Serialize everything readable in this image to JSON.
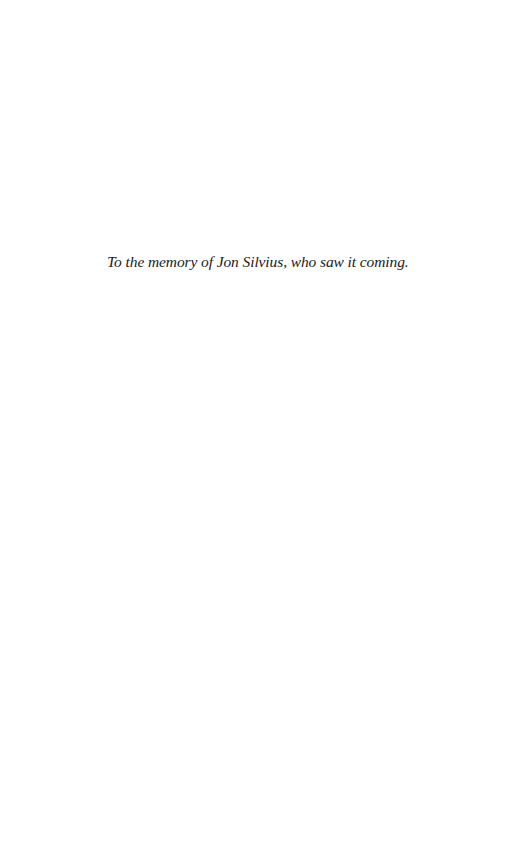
{
  "page": {
    "background": "#ffffff",
    "dedication": "To the memory of Jon Silvius, who saw it coming."
  }
}
